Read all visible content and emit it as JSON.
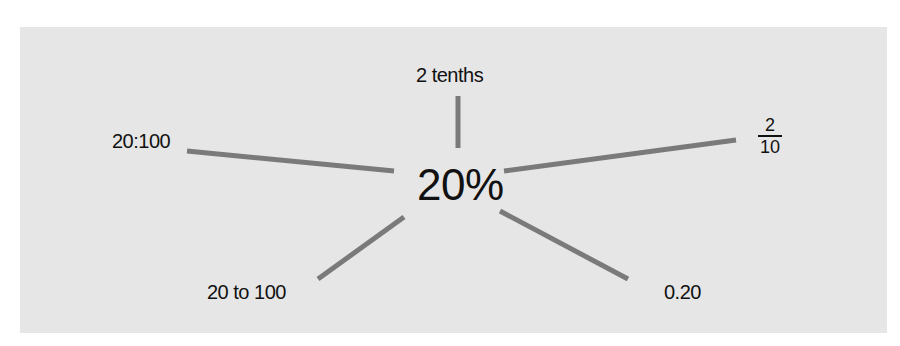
{
  "diagram": {
    "center_label": "20%",
    "spokes": [
      {
        "id": "top",
        "label": "2 tenths"
      },
      {
        "id": "left",
        "label": "20:100"
      },
      {
        "id": "right",
        "fraction": {
          "numerator": "2",
          "denominator": "10"
        }
      },
      {
        "id": "bottom-left",
        "label": "20 to 100"
      },
      {
        "id": "bottom-right",
        "label": "0.20"
      }
    ],
    "colors": {
      "panel": "#e6e6e6",
      "spoke": "#7a7a7a",
      "text": "#111111"
    }
  }
}
